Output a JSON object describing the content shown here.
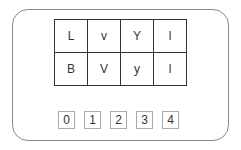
{
  "grid": {
    "rows": [
      [
        "L",
        "v",
        "Y",
        "l"
      ],
      [
        "B",
        "V",
        "y",
        "l"
      ]
    ]
  },
  "options": [
    "0",
    "1",
    "2",
    "3",
    "4"
  ]
}
